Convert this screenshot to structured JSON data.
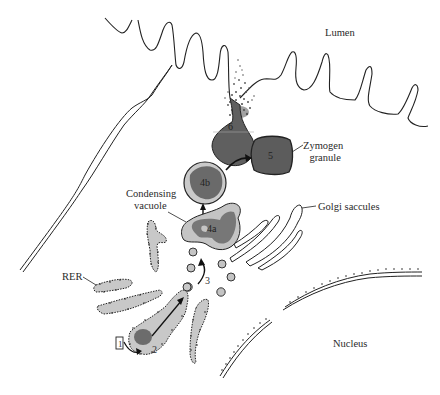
{
  "diagram": {
    "labels": {
      "lumen": "Lumen",
      "zymogen_line1": "Zymogen",
      "zymogen_line2": "granule",
      "condensing_line1": "Condensing",
      "condensing_line2": "vacuole",
      "golgi": "Golgi saccules",
      "rer": "RER",
      "nucleus": "Nucleus"
    },
    "steps": {
      "s1": "1",
      "s2": "2",
      "s3": "3",
      "s4a": "4a",
      "s4b": "4b",
      "s5": "5",
      "s6": "6"
    },
    "colors": {
      "cytoplasm_fill": "#c8c8c8",
      "content_dark": "#6e6e6e",
      "granule_dark": "#5a5a5a",
      "outline": "#222222",
      "background": "#ffffff"
    }
  }
}
